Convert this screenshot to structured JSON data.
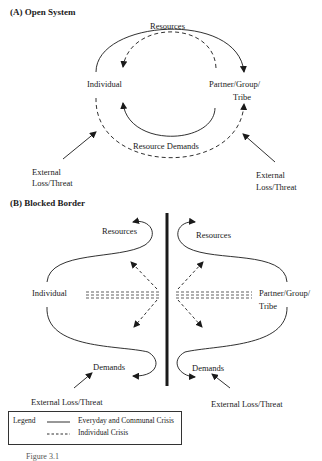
{
  "panel_a": {
    "title": "(A)  Open System",
    "nodes": {
      "individual": "Individual",
      "partner_line1": "Partner/Group/",
      "partner_line2": "Tribe"
    },
    "flows": {
      "resources": "Resources",
      "resource_demands": "Resource Demands"
    },
    "external_left_line1": "External",
    "external_left_line2": "Loss/Threat",
    "external_right_line1": "External",
    "external_right_line2": "Loss/Threat"
  },
  "panel_b": {
    "title": "(B)  Blocked Border",
    "nodes": {
      "individual": "Individual",
      "partner_line1": "Partner/Group/",
      "partner_line2": "Tribe"
    },
    "flows": {
      "resources_left": "Resources",
      "resources_right": "Resources",
      "demands_left": "Demands",
      "demands_right": "Demands"
    },
    "external_left": "External Loss/Threat",
    "external_right": "External Loss/Threat"
  },
  "legend": {
    "title": "Legend",
    "items": [
      {
        "style": "solid",
        "label": "Everyday and Communal Crisis"
      },
      {
        "style": "dashed",
        "label": "Individual Crisis"
      }
    ]
  },
  "caption": "Figure 3.1"
}
